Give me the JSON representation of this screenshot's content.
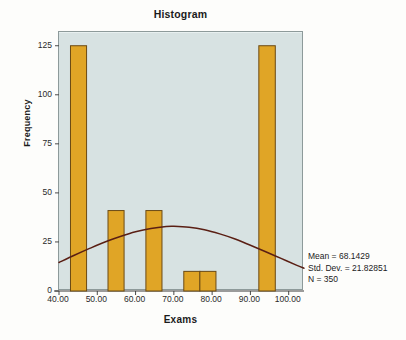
{
  "chart_data": {
    "type": "bar",
    "title": "Histogram",
    "xlabel": "Exams",
    "ylabel": "Frequency",
    "xlim": [
      40,
      104
    ],
    "ylim": [
      0,
      132
    ],
    "grid": false,
    "legend": "none",
    "bar_color": "#e0a526",
    "bar_edge_color": "#6b4a14",
    "plot_background": "#d7e2e2",
    "curve_color": "#5a1f14",
    "x_ticks": [
      40,
      50,
      60,
      70,
      80,
      90,
      100
    ],
    "x_tick_labels": [
      "40.00",
      "50.00",
      "60.00",
      "70.00",
      "80.00",
      "90.00",
      "100.00"
    ],
    "y_ticks": [
      0,
      25,
      50,
      75,
      100,
      125
    ],
    "y_tick_labels": [
      "0",
      "25",
      "50",
      "75",
      "100",
      "125"
    ],
    "bins": [
      {
        "x0": 43.0,
        "x1": 47.2,
        "value": 125
      },
      {
        "x0": 52.8,
        "x1": 57.0,
        "value": 41
      },
      {
        "x0": 62.7,
        "x1": 66.9,
        "value": 41
      },
      {
        "x0": 72.6,
        "x1": 76.8,
        "value": 10
      },
      {
        "x0": 76.8,
        "x1": 81.0,
        "value": 10
      },
      {
        "x0": 92.2,
        "x1": 96.5,
        "value": 125
      }
    ],
    "normal_curve": {
      "mean": 68.1429,
      "std_dev": 21.82851,
      "peak_value": 33,
      "points": [
        {
          "x": 40.0,
          "y": 14.5
        },
        {
          "x": 44.0,
          "y": 18.2
        },
        {
          "x": 48.0,
          "y": 21.7
        },
        {
          "x": 52.0,
          "y": 25.0
        },
        {
          "x": 56.0,
          "y": 27.8
        },
        {
          "x": 60.0,
          "y": 30.2
        },
        {
          "x": 64.0,
          "y": 31.9
        },
        {
          "x": 68.0,
          "y": 32.9
        },
        {
          "x": 70.0,
          "y": 33.0
        },
        {
          "x": 74.0,
          "y": 32.5
        },
        {
          "x": 78.0,
          "y": 31.2
        },
        {
          "x": 82.0,
          "y": 29.1
        },
        {
          "x": 86.0,
          "y": 26.5
        },
        {
          "x": 90.0,
          "y": 23.3
        },
        {
          "x": 94.0,
          "y": 20.0
        },
        {
          "x": 98.0,
          "y": 16.6
        },
        {
          "x": 102.0,
          "y": 13.2
        },
        {
          "x": 104.0,
          "y": 11.6
        }
      ]
    },
    "annotation": {
      "mean_line": "Mean = 68.1429",
      "std_dev_line": "Std. Dev. = 21.82851",
      "n_line": "N = 350"
    }
  }
}
